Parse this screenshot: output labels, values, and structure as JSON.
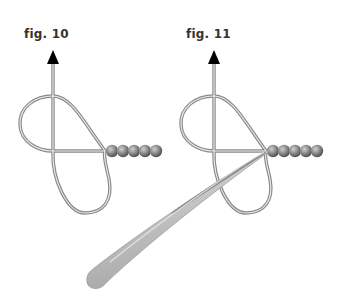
{
  "figures": [
    {
      "id": "fig10",
      "label": "fig. 10",
      "description": "Wire loop knot with arrow pointing up and bead strand",
      "bead_count": 5,
      "has_tweezers": false
    },
    {
      "id": "fig11",
      "label": "fig. 11",
      "description": "Same loop knot with tweezers tightening at the bead junction",
      "bead_count": 5,
      "has_tweezers": true
    }
  ],
  "colors": {
    "wire_outer": "#8a8a8a",
    "wire_inner": "#e6e6e6",
    "arrow": "#000000",
    "bead_dark": "#5e5e5e",
    "bead_light": "#b8b8b8",
    "tweezer_light": "#d6d6d6",
    "tweezer_dark": "#7a7a7a",
    "label_text": "#333333"
  }
}
